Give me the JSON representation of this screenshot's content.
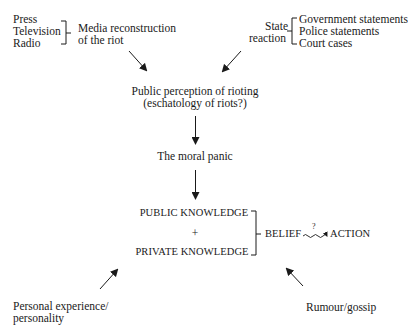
{
  "diagram": {
    "media_sources": {
      "items": [
        "Press",
        "Television",
        "Radio"
      ],
      "label_line1": "Media reconstruction",
      "label_line2": "of the riot"
    },
    "state": {
      "label_line1": "State",
      "label_line2": "reaction",
      "items": [
        "Government statements",
        "Police statements",
        "Court cases"
      ]
    },
    "public_perception": {
      "line1": "Public perception of rioting",
      "line2": "(eschatology of riots?)"
    },
    "moral_panic": "The moral panic",
    "knowledge": {
      "public": "PUBLIC KNOWLEDGE",
      "plus": "+",
      "private": "PRIVATE KNOWLEDGE"
    },
    "belief": "BELIEF",
    "uncertain_link_mark": "?",
    "action": "ACTION",
    "personal": {
      "line1": "Personal experience/",
      "line2": "personality"
    },
    "rumour": "Rumour/gossip"
  }
}
